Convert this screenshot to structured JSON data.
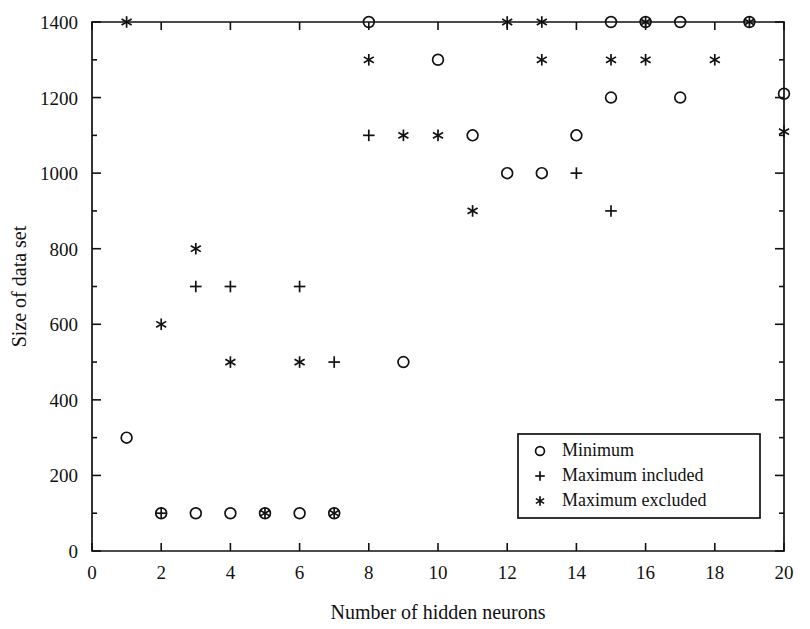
{
  "chart_data": {
    "type": "scatter",
    "title": "",
    "xlabel": "Number of hidden neurons",
    "ylabel": "Size of data set",
    "xlim": [
      0,
      20
    ],
    "ylim": [
      0,
      1400
    ],
    "xticks": [
      0,
      2,
      4,
      6,
      8,
      10,
      12,
      14,
      16,
      18,
      20
    ],
    "xtick_labels": [
      "0",
      "2",
      "4",
      "6",
      "8",
      "10",
      "12",
      "14",
      "16",
      "18",
      "20"
    ],
    "yticks": [
      0,
      200,
      400,
      600,
      800,
      1000,
      1200,
      1400
    ],
    "ytick_labels": [
      "0",
      "200",
      "400",
      "600",
      "800",
      "1000",
      "1200",
      "1400"
    ],
    "grid": false,
    "legend_position": "lower-right",
    "series": [
      {
        "name": "Minimum",
        "marker": "circle",
        "points": [
          {
            "x": 1,
            "y": 300
          },
          {
            "x": 2,
            "y": 100
          },
          {
            "x": 3,
            "y": 100
          },
          {
            "x": 4,
            "y": 100
          },
          {
            "x": 5,
            "y": 100
          },
          {
            "x": 6,
            "y": 100
          },
          {
            "x": 7,
            "y": 100
          },
          {
            "x": 8,
            "y": 1400
          },
          {
            "x": 9,
            "y": 500
          },
          {
            "x": 10,
            "y": 1300
          },
          {
            "x": 11,
            "y": 1100
          },
          {
            "x": 12,
            "y": 1000
          },
          {
            "x": 13,
            "y": 1000
          },
          {
            "x": 14,
            "y": 1100
          },
          {
            "x": 15,
            "y": 1200
          },
          {
            "x": 15,
            "y": 1400
          },
          {
            "x": 16,
            "y": 1400
          },
          {
            "x": 17,
            "y": 1200
          },
          {
            "x": 17,
            "y": 1400
          },
          {
            "x": 19,
            "y": 1400
          },
          {
            "x": 20,
            "y": 1210
          }
        ]
      },
      {
        "name": "Maximum included",
        "marker": "plus",
        "points": [
          {
            "x": 2,
            "y": 100
          },
          {
            "x": 3,
            "y": 700
          },
          {
            "x": 4,
            "y": 700
          },
          {
            "x": 6,
            "y": 700
          },
          {
            "x": 7,
            "y": 500
          },
          {
            "x": 8,
            "y": 1100
          },
          {
            "x": 14,
            "y": 1000
          },
          {
            "x": 15,
            "y": 900
          }
        ]
      },
      {
        "name": "Maximum excluded",
        "marker": "star",
        "points": [
          {
            "x": 1,
            "y": 1400
          },
          {
            "x": 2,
            "y": 600
          },
          {
            "x": 3,
            "y": 800
          },
          {
            "x": 4,
            "y": 500
          },
          {
            "x": 5,
            "y": 100
          },
          {
            "x": 6,
            "y": 500
          },
          {
            "x": 7,
            "y": 100
          },
          {
            "x": 8,
            "y": 1300
          },
          {
            "x": 9,
            "y": 1100
          },
          {
            "x": 10,
            "y": 1100
          },
          {
            "x": 11,
            "y": 900
          },
          {
            "x": 12,
            "y": 1400
          },
          {
            "x": 13,
            "y": 1300
          },
          {
            "x": 13,
            "y": 1400
          },
          {
            "x": 15,
            "y": 1300
          },
          {
            "x": 16,
            "y": 1300
          },
          {
            "x": 16,
            "y": 1400
          },
          {
            "x": 18,
            "y": 1300
          },
          {
            "x": 19,
            "y": 1400
          },
          {
            "x": 20,
            "y": 1110
          }
        ]
      }
    ],
    "legend_entries": [
      {
        "marker": "circle",
        "label": "Minimum"
      },
      {
        "marker": "plus",
        "label": "Maximum included"
      },
      {
        "marker": "star",
        "label": "Maximum excluded"
      }
    ],
    "colors": {
      "marker": "#111111",
      "axis": "#111111",
      "background": "#ffffff"
    }
  }
}
